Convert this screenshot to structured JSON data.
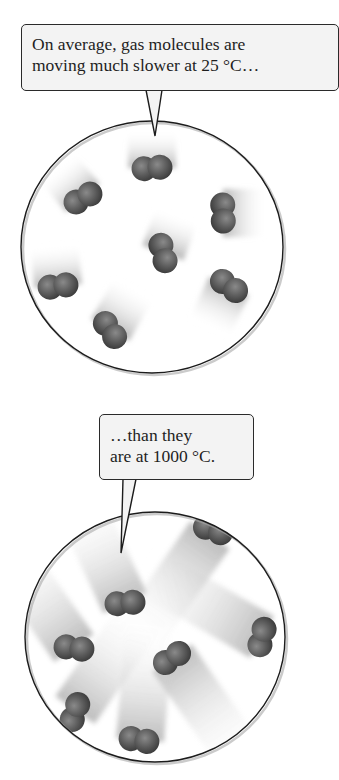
{
  "figure": {
    "top_panel": {
      "callout": {
        "line1": "On average, gas molecules are",
        "line2": "moving much slower at 25 °C…"
      },
      "temperature": "25 °C",
      "molecule_count": 7,
      "motion": "slow (short motion trails)"
    },
    "bottom_panel": {
      "callout": {
        "line1": "…than they",
        "line2": "are at 1000 °C."
      },
      "temperature": "1000 °C",
      "molecule_count": 7,
      "motion": "fast (long motion trails)"
    },
    "colors": {
      "background": "#ffffff",
      "callout_fill": "#f3f3f3",
      "outline": "#2a2a2a",
      "molecule": "#5a5a5a",
      "trail": "#bdbdbd"
    }
  }
}
